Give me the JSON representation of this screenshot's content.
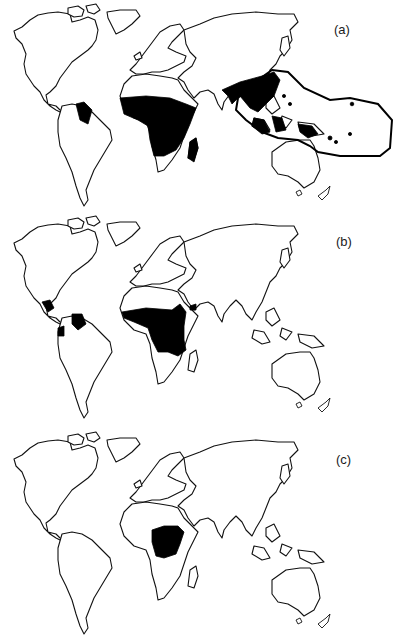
{
  "figure": {
    "panels": [
      {
        "id": "a",
        "label": "(a)",
        "top": 0,
        "label_x": 334,
        "label_y": 22,
        "shaded_regions": [
          "northern South America (Guianas)",
          "sub-Saharan Africa",
          "Madagascar",
          "South & Southeast Asia",
          "Indonesia / New Guinea islands"
        ],
        "outlined_region": "Indo-Pacific envelope enclosing Southeast Asia to western Pacific"
      },
      {
        "id": "b",
        "label": "(b)",
        "top": 212,
        "label_x": 336,
        "label_y": 22,
        "shaded_regions": [
          "southern Mexico / Central America",
          "northern South America (Venezuela/Guianas)",
          "Colombia/Ecuador west coast",
          "central Africa belt",
          "southwest Arabian peninsula (Yemen)"
        ]
      },
      {
        "id": "c",
        "label": "(c)",
        "top": 425,
        "label_x": 336,
        "label_y": 26,
        "shaded_regions": [
          "Central Africa (Congo basin)"
        ]
      }
    ],
    "colors": {
      "land_fill": "#ffffff",
      "coastline": "#111111",
      "range_fill": "#000000",
      "background": "#ffffff"
    }
  }
}
